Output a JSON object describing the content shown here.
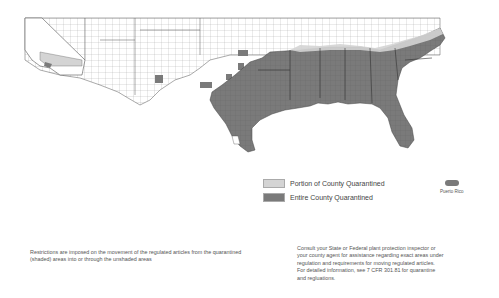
{
  "map": {
    "title": "",
    "colors": {
      "entire": "#7a7a7a",
      "portion": "#d4d4d4",
      "unshaded": "#ffffff",
      "county_lines": "#555555"
    },
    "regions_entire": [
      "Texas (eastern)",
      "Louisiana",
      "Mississippi",
      "Alabama",
      "Georgia",
      "Florida",
      "South Carolina",
      "North Carolina (eastern)",
      "Arkansas (southern)",
      "Oklahoma (partial)",
      "Arizona (partial)",
      "California (partial)"
    ],
    "regions_portion": [
      "California (southern)",
      "Tennessee (southern)",
      "North Carolina",
      "Oklahoma (partial)"
    ]
  },
  "legend": {
    "items": [
      {
        "label": "Portion of County Quarantined",
        "color": "#d4d4d4"
      },
      {
        "label": "Entire County Quarantined",
        "color": "#7a7a7a"
      }
    ],
    "puerto_rico_label": "Puerto Rico"
  },
  "notes": {
    "left": "Restrictions are imposed on the movement of the regulated articles from the quarantined (shaded) areas into or through the unshaded areas",
    "right_lines": [
      "Consult your State or Federal plant protection inspector or",
      "your county agent for assistance regarding exact areas under",
      "regulation and requirements for moving regulated articles.",
      "For detailed information, see 7 CFR 301.81 for quarantine",
      "and regluations."
    ]
  }
}
